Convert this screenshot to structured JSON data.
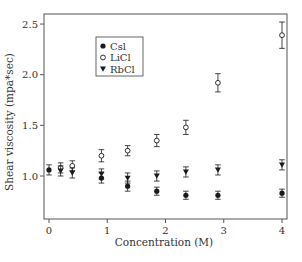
{
  "chart_data": {
    "type": "scatter",
    "title": "",
    "xlabel": "Concentration (M)",
    "ylabel": "Shear viscosity (mpa*sec)",
    "xlim": [
      -0.1,
      4.1
    ],
    "ylim": [
      0.55,
      2.6
    ],
    "x_ticks": [
      0,
      1,
      2,
      3,
      4
    ],
    "x_tick_labels": [
      "0",
      "1",
      "2",
      "3",
      "4"
    ],
    "y_ticks": [
      1.0,
      1.5,
      2.0,
      2.5
    ],
    "y_tick_labels": [
      "1.0",
      "1.5",
      "2.0",
      "2.5"
    ],
    "grid": false,
    "legend_position": "upper-left-inside",
    "error_bars": true,
    "series": [
      {
        "name": "Csl",
        "marker": "filled-circle",
        "points": [
          {
            "x": 0.0,
            "y": 1.06,
            "err": 0.05
          },
          {
            "x": 0.9,
            "y": 0.98,
            "err": 0.05
          },
          {
            "x": 1.35,
            "y": 0.9,
            "err": 0.05
          },
          {
            "x": 1.85,
            "y": 0.85,
            "err": 0.04
          },
          {
            "x": 2.35,
            "y": 0.81,
            "err": 0.04
          },
          {
            "x": 2.9,
            "y": 0.81,
            "err": 0.04
          },
          {
            "x": 4.0,
            "y": 0.83,
            "err": 0.04
          }
        ]
      },
      {
        "name": "LiCl",
        "marker": "open-circle",
        "points": [
          {
            "x": 0.2,
            "y": 1.08,
            "err": 0.05
          },
          {
            "x": 0.4,
            "y": 1.1,
            "err": 0.05
          },
          {
            "x": 0.9,
            "y": 1.2,
            "err": 0.06
          },
          {
            "x": 1.35,
            "y": 1.25,
            "err": 0.05
          },
          {
            "x": 1.85,
            "y": 1.35,
            "err": 0.06
          },
          {
            "x": 2.35,
            "y": 1.48,
            "err": 0.07
          },
          {
            "x": 2.9,
            "y": 1.92,
            "err": 0.09
          },
          {
            "x": 4.0,
            "y": 2.39,
            "err": 0.13
          }
        ]
      },
      {
        "name": "RbCl",
        "marker": "filled-triangle-down",
        "points": [
          {
            "x": 0.2,
            "y": 1.05,
            "err": 0.05
          },
          {
            "x": 0.4,
            "y": 1.03,
            "err": 0.05
          },
          {
            "x": 0.9,
            "y": 1.02,
            "err": 0.05
          },
          {
            "x": 1.35,
            "y": 0.98,
            "err": 0.05
          },
          {
            "x": 1.85,
            "y": 1.0,
            "err": 0.05
          },
          {
            "x": 2.35,
            "y": 1.04,
            "err": 0.05
          },
          {
            "x": 2.9,
            "y": 1.06,
            "err": 0.05
          },
          {
            "x": 4.0,
            "y": 1.11,
            "err": 0.05
          }
        ]
      }
    ]
  },
  "colors": {
    "axis": "#555555",
    "marker": "#1a1a1a",
    "text": "#333333"
  }
}
